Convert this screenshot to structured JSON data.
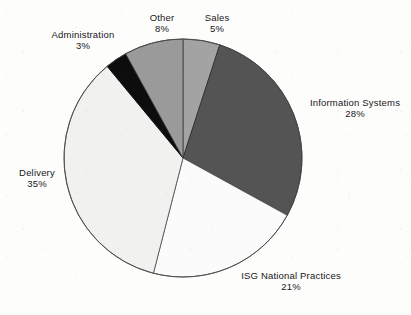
{
  "chart_data": {
    "type": "pie",
    "title": "",
    "subtitle": "",
    "xlabel": "",
    "ylabel": "",
    "legend": "none",
    "grid": false,
    "units": "percent",
    "total": 100,
    "start_angle_deg": 0,
    "direction": "clockwise",
    "categories": [
      "Sales",
      "Information Systems",
      "ISG National Practices",
      "Delivery",
      "Administration",
      "Other"
    ],
    "values": [
      5,
      28,
      21,
      35,
      3,
      8
    ],
    "slices": [
      {
        "label": "Sales",
        "value": 5,
        "value_text": "5%",
        "color": "#a3a3a3",
        "stroke": "#3d3d3d",
        "start_deg": 0,
        "end_deg": 18
      },
      {
        "label": "Information Systems",
        "value": 28,
        "value_text": "28%",
        "color": "#545454",
        "stroke": "#2a2a2a",
        "start_deg": 18,
        "end_deg": 118.8
      },
      {
        "label": "ISG National Practices",
        "value": 21,
        "value_text": "21%",
        "color": "#fbfbfb",
        "stroke": "#4a4a4a",
        "start_deg": 118.8,
        "end_deg": 194.4
      },
      {
        "label": "Delivery",
        "value": 35,
        "value_text": "35%",
        "color": "#f1f1f0",
        "stroke": "#4a4a4a",
        "start_deg": 194.4,
        "end_deg": 320.4
      },
      {
        "label": "Administration",
        "value": 3,
        "value_text": "3%",
        "color": "#0d0d0d",
        "stroke": "#0d0d0d",
        "start_deg": 320.4,
        "end_deg": 331.2
      },
      {
        "label": "Other",
        "value": 8,
        "value_text": "8%",
        "color": "#9a9a9a",
        "stroke": "#3d3d3d",
        "start_deg": 331.2,
        "end_deg": 360
      }
    ],
    "geometry": {
      "center_x": 183,
      "center_y": 158,
      "radius": 119
    }
  },
  "labels": {
    "sales": {
      "name": "Sales",
      "pct": "5%"
    },
    "information_systems": {
      "name": "Information Systems",
      "pct": "28%"
    },
    "isg_national_practices": {
      "name": "ISG National Practices",
      "pct": "21%"
    },
    "delivery": {
      "name": "Delivery",
      "pct": "35%"
    },
    "administration": {
      "name": "Administration",
      "pct": "3%"
    },
    "other": {
      "name": "Other",
      "pct": "8%"
    }
  },
  "colors": {
    "background": "#fdfdfc",
    "text": "#17171a",
    "slice_dark": "#545454",
    "slice_black": "#0d0d0d",
    "slice_mid_gray": "#9a9a9a",
    "slice_light_gray": "#a3a3a3",
    "slice_white": "#fbfbfb",
    "slice_offwhite": "#f1f1f0",
    "outline": "#4a4a4a"
  }
}
